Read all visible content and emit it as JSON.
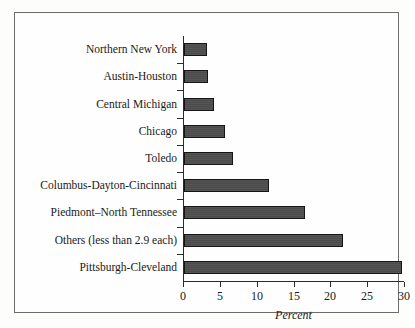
{
  "chart_data": {
    "type": "bar",
    "orientation": "horizontal",
    "title": "",
    "xlabel": "Percent",
    "ylabel": "",
    "categories": [
      "Northern New York",
      "Austin-Houston",
      "Central Michigan",
      "Chicago",
      "Toledo",
      "Columbus-Dayton-Cincinnati",
      "Piedmont–North Tennessee",
      "Others (less than 2.9 each)",
      "Pittsburgh-Cleveland"
    ],
    "values": [
      3.1,
      3.3,
      4.1,
      5.6,
      6.7,
      11.5,
      16.4,
      21.6,
      29.6
    ],
    "xticks": [
      0,
      5,
      10,
      15,
      20,
      25,
      30
    ],
    "xtick_labels": [
      "0",
      "5",
      "10",
      "15",
      "20",
      "25",
      "30"
    ],
    "xlim": [
      0,
      30
    ],
    "grid": false,
    "legend": null,
    "bar_color": "#4b4b4b",
    "bar_edge_color": "#151515",
    "axis_color": "#2b2b2b",
    "frame_color": "#6d6d6d",
    "background": "#fefefe"
  }
}
